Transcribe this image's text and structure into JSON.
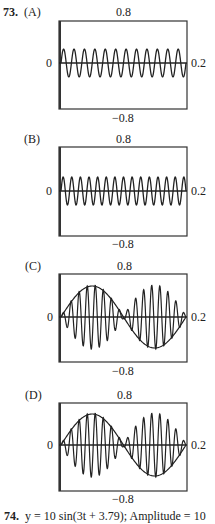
{
  "problem73": {
    "number": "73.",
    "panels": [
      {
        "label": "(A)",
        "ymax": "0.8",
        "ymin": "−0.8",
        "xmin": "0",
        "xmax": "0.2"
      },
      {
        "label": "(B)",
        "ymax": "0.8",
        "ymin": "−0.8",
        "xmin": "0",
        "xmax": "0.2"
      },
      {
        "label": "(C)",
        "ymax": "0.8",
        "ymin": "−0.8",
        "xmin": "0",
        "xmax": "0.2"
      },
      {
        "label": "(D)",
        "ymax": "0.8",
        "ymin": "−0.8",
        "xmin": "0",
        "xmax": "0.2"
      }
    ]
  },
  "problem74": {
    "number": "74.",
    "text": "y = 10 sin(3t + 3.79); Amplitude = 10"
  },
  "chart_data": [
    {
      "type": "line",
      "title": "(A)",
      "xlim": [
        0,
        0.2
      ],
      "ylim": [
        -0.8,
        0.8
      ],
      "xlabel": "",
      "ylabel": "",
      "grid": false,
      "series": [
        {
          "name": "signal",
          "description": "constant-amplitude sinusoid, ~12 cycles, amplitude ~0.25"
        }
      ]
    },
    {
      "type": "line",
      "title": "(B)",
      "xlim": [
        0,
        0.2
      ],
      "ylim": [
        -0.8,
        0.8
      ],
      "xlabel": "",
      "ylabel": "",
      "grid": false,
      "series": [
        {
          "name": "signal",
          "description": "constant-amplitude sinusoid, ~14 cycles, amplitude ~0.22"
        }
      ]
    },
    {
      "type": "line",
      "title": "(C)",
      "xlim": [
        0,
        0.2
      ],
      "ylim": [
        -0.8,
        0.8
      ],
      "xlabel": "",
      "ylabel": "",
      "grid": false,
      "series": [
        {
          "name": "envelope",
          "description": "one full sine cycle, amplitude ~0.5"
        },
        {
          "name": "signal",
          "description": "high-frequency oscillation modulated by the envelope (beats), ~15 cycles"
        }
      ]
    },
    {
      "type": "line",
      "title": "(D)",
      "xlim": [
        0,
        0.2
      ],
      "ylim": [
        -0.8,
        0.8
      ],
      "xlabel": "",
      "ylabel": "",
      "grid": false,
      "series": [
        {
          "name": "envelope",
          "description": "one full sine cycle, amplitude ~0.5"
        },
        {
          "name": "signal",
          "description": "high-frequency oscillation modulated by the envelope (beats), ~15 cycles"
        }
      ]
    }
  ]
}
